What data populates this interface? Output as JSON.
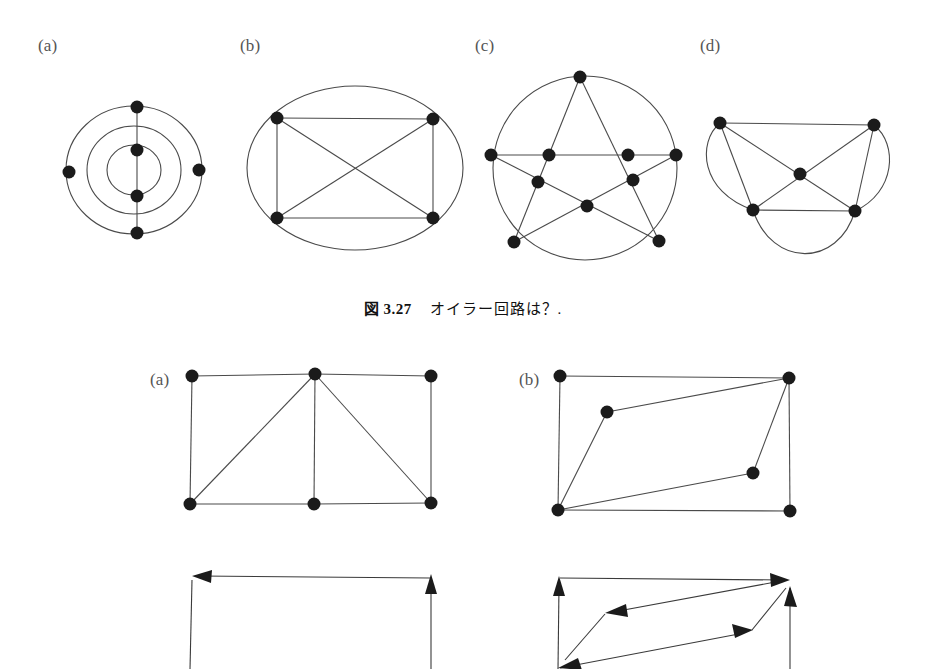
{
  "figure": {
    "caption_number": "図 3.27",
    "caption_text": "オイラー回路は？.",
    "background_color": "#ffffff",
    "edge_color": "#4a4a4a",
    "node_color": "#1b1b1b"
  },
  "top_row": {
    "labels": [
      {
        "text": "(a)",
        "x": 38,
        "y": 36
      },
      {
        "text": "(b)",
        "x": 240,
        "y": 36
      },
      {
        "text": "(c)",
        "x": 475,
        "y": 36
      },
      {
        "text": "(d)",
        "x": 700,
        "y": 36
      }
    ],
    "graph_a": {
      "name": "concentric-ellipses-graph",
      "description": "Three concentric ellipses crossed by a vertical line",
      "vertices": [
        {
          "x": 137,
          "y": 107
        },
        {
          "x": 137,
          "y": 150
        },
        {
          "x": 137,
          "y": 196
        },
        {
          "x": 137,
          "y": 233
        },
        {
          "x": 69,
          "y": 172
        },
        {
          "x": 199,
          "y": 170
        }
      ],
      "vertex_count": 6
    },
    "graph_b": {
      "name": "k4-in-ellipse-graph",
      "description": "Complete graph K4 drawn inside an ellipse",
      "vertices": [
        {
          "x": 277,
          "y": 118
        },
        {
          "x": 433,
          "y": 119
        },
        {
          "x": 277,
          "y": 218
        },
        {
          "x": 433,
          "y": 218
        }
      ],
      "vertex_count": 4
    },
    "graph_c": {
      "name": "pentagram-in-circle-graph",
      "description": "Five pointed star inscribed in a circle with ten vertices",
      "vertices": [
        {
          "x": 580,
          "y": 77
        },
        {
          "x": 491,
          "y": 155
        },
        {
          "x": 676,
          "y": 155
        },
        {
          "x": 514,
          "y": 242
        },
        {
          "x": 659,
          "y": 241
        },
        {
          "x": 549,
          "y": 155
        },
        {
          "x": 628,
          "y": 155
        },
        {
          "x": 538,
          "y": 182
        },
        {
          "x": 633,
          "y": 180
        },
        {
          "x": 587,
          "y": 206
        }
      ],
      "vertex_count": 10
    },
    "graph_d": {
      "name": "five-vertex-curved-graph",
      "description": "Four corner vertices plus a center vertex with curved outer edges",
      "vertices": [
        {
          "x": 720,
          "y": 123
        },
        {
          "x": 874,
          "y": 125
        },
        {
          "x": 753,
          "y": 210
        },
        {
          "x": 855,
          "y": 211
        },
        {
          "x": 800,
          "y": 174
        }
      ],
      "vertex_count": 5
    }
  },
  "bottom_row": {
    "labels": [
      {
        "text": "(a)",
        "x": 150,
        "y": 370
      },
      {
        "text": "(b)",
        "x": 519,
        "y": 370
      }
    ],
    "graph_a": {
      "name": "rectangle-grid-graph",
      "description": "Rectangle split into two cells with two diagonals",
      "vertices": [
        {
          "x": 192,
          "y": 376
        },
        {
          "x": 315,
          "y": 374
        },
        {
          "x": 431,
          "y": 376
        },
        {
          "x": 190,
          "y": 504
        },
        {
          "x": 314,
          "y": 504
        },
        {
          "x": 431,
          "y": 503
        }
      ],
      "vertex_count": 6
    },
    "graph_b": {
      "name": "rectangle-zigzag-graph",
      "description": "Rectangle with two interior vertices forming a zigzag path",
      "vertices": [
        {
          "x": 560,
          "y": 376
        },
        {
          "x": 789,
          "y": 378
        },
        {
          "x": 558,
          "y": 510
        },
        {
          "x": 790,
          "y": 511
        },
        {
          "x": 607,
          "y": 412
        },
        {
          "x": 753,
          "y": 473
        }
      ],
      "vertex_count": 6
    },
    "digraph_a": {
      "name": "directed-rectangle-grid",
      "description": "Directed version of bottom graph (a), partially cropped",
      "arrows": [
        {
          "direction": "left"
        },
        {
          "direction": "up"
        }
      ]
    },
    "digraph_b": {
      "name": "directed-rectangle-zigzag",
      "description": "Directed version of bottom graph (b), partially cropped",
      "arrows": [
        {
          "direction": "up"
        },
        {
          "direction": "right"
        },
        {
          "direction": "left"
        },
        {
          "direction": "up"
        },
        {
          "direction": "down-left"
        },
        {
          "direction": "right"
        }
      ]
    }
  }
}
